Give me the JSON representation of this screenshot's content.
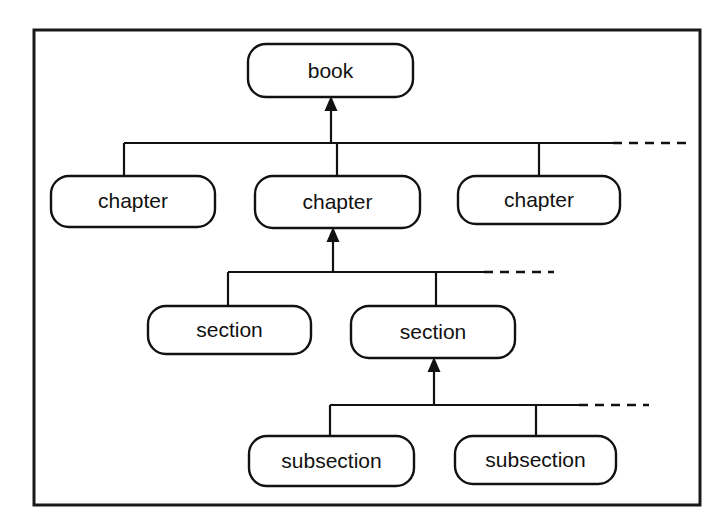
{
  "diagram": {
    "type": "tree-hierarchy",
    "frame": {
      "border_color": "#1a1a1a",
      "background": "#ffffff"
    },
    "line_color": "#111111",
    "levels": [
      {
        "name": "root",
        "nodes": [
          {
            "id": "book",
            "label": "book"
          }
        ]
      },
      {
        "name": "chapters",
        "nodes": [
          {
            "id": "chapter-1",
            "label": "chapter"
          },
          {
            "id": "chapter-2",
            "label": "chapter"
          },
          {
            "id": "chapter-3",
            "label": "chapter"
          }
        ],
        "continues": true
      },
      {
        "name": "sections",
        "nodes": [
          {
            "id": "section-1",
            "label": "section"
          },
          {
            "id": "section-2",
            "label": "section"
          }
        ],
        "continues": true
      },
      {
        "name": "subsections",
        "nodes": [
          {
            "id": "subsection-1",
            "label": "subsection"
          },
          {
            "id": "subsection-2",
            "label": "subsection"
          }
        ],
        "continues": true
      }
    ],
    "edges": [
      {
        "from": "chapters",
        "to": "book",
        "arrow": "up"
      },
      {
        "from": "sections",
        "to": "chapter-2",
        "arrow": "up"
      },
      {
        "from": "subsections",
        "to": "section-2",
        "arrow": "up"
      }
    ],
    "labels": {
      "book": "book",
      "chapter_1": "chapter",
      "chapter_2": "chapter",
      "chapter_3": "chapter",
      "section_1": "section",
      "section_2": "section",
      "subsection_1": "subsection",
      "subsection_2": "subsection"
    }
  }
}
